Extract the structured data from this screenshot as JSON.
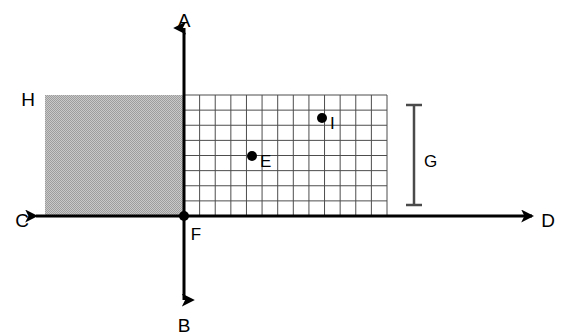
{
  "diagram": {
    "background_color": "#ffffff",
    "line_color": "#000000",
    "grid_line_color": "#4d4d4d",
    "shade_color": "#b5b5b5",
    "canvas": {
      "width": 567,
      "height": 335
    },
    "axes": {
      "origin": {
        "x": 184,
        "y": 216
      },
      "vertical": {
        "top_label": "A",
        "bottom_label": "B",
        "top_label_pos": {
          "x": 184,
          "y": 22
        },
        "bottom_label_pos": {
          "x": 184,
          "y": 327
        },
        "x": 184,
        "y_top": 28,
        "y_bottom": 300
      },
      "horizontal": {
        "left_label": "C",
        "right_label": "D",
        "left_label_pos": {
          "x": 22,
          "y": 222
        },
        "right_label_pos": {
          "x": 548,
          "y": 222
        },
        "y": 216,
        "x_left": 36,
        "x_right": 532
      }
    },
    "origin_point": {
      "label": "F",
      "x": 184,
      "y": 216,
      "label_pos": {
        "x": 196,
        "y": 236
      }
    },
    "shaded_region": {
      "corner_label": "H",
      "corner_label_pos": {
        "x": 28,
        "y": 101
      },
      "x": 45,
      "y": 95,
      "width": 139,
      "height": 121
    },
    "grid": {
      "x": 184,
      "y": 95,
      "width": 203,
      "height": 121,
      "columns": 13,
      "rows": 8,
      "cell_width": 15.6,
      "cell_height": 15.1
    },
    "points": [
      {
        "label": "E",
        "x": 252,
        "y": 156,
        "label_pos": {
          "x": 260,
          "y": 163
        },
        "label_orientation": "right"
      },
      {
        "label": "I",
        "x": 322,
        "y": 118,
        "label_pos": {
          "x": 330,
          "y": 125
        },
        "label_orientation": "right"
      }
    ],
    "dimension": {
      "label": "G",
      "label_pos": {
        "x": 424,
        "y": 163
      },
      "x": 414,
      "y_top": 105,
      "y_bottom": 205,
      "cap_half_width": 8
    }
  }
}
